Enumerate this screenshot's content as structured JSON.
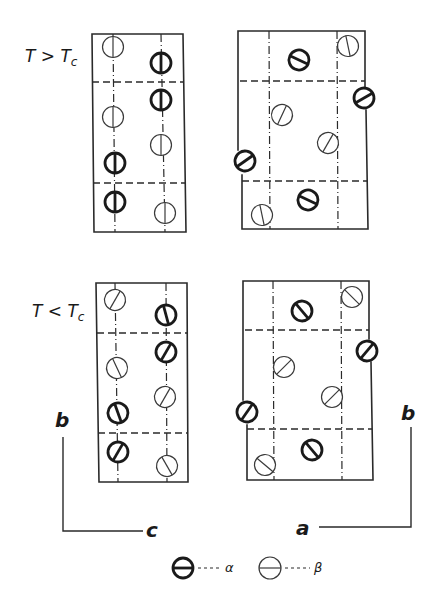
{
  "labels": {
    "above": {
      "main": "T > T",
      "sub": "c"
    },
    "below": {
      "main": "T < T",
      "sub": "c"
    },
    "axis_left_vertical": "b",
    "axis_left_horizontal": "c",
    "axis_right_vertical": "b",
    "axis_right_horizontal": "a"
  },
  "legend": [
    {
      "type": "alpha",
      "symbol": "α"
    },
    {
      "type": "beta",
      "symbol": "β"
    }
  ],
  "colors": {
    "ink": "#1a1a1a",
    "background": "#ffffff"
  },
  "panels": [
    {
      "id": "above-bc",
      "state": "T > Tc",
      "projection": "bc",
      "frame": [
        [
          92,
          34
        ],
        [
          183,
          34
        ],
        [
          186,
          232
        ],
        [
          94,
          232
        ],
        [
          92,
          34
        ]
      ],
      "dash_h": [
        [
          [
            92,
            82
          ],
          [
            184,
            82
          ]
        ],
        [
          [
            93,
            183
          ],
          [
            186,
            183
          ]
        ]
      ],
      "dash_v": [
        [
          [
            113,
            34
          ],
          [
            115,
            232
          ]
        ],
        [
          [
            161,
            34
          ],
          [
            165,
            232
          ]
        ]
      ],
      "atoms": [
        {
          "type": "beta",
          "x": 113,
          "y": 47,
          "angle": 90
        },
        {
          "type": "alpha",
          "x": 161,
          "y": 63,
          "angle": 90
        },
        {
          "type": "alpha",
          "x": 161,
          "y": 100,
          "angle": 90
        },
        {
          "type": "beta",
          "x": 113,
          "y": 117,
          "angle": 90
        },
        {
          "type": "beta",
          "x": 161,
          "y": 145,
          "angle": 90
        },
        {
          "type": "alpha",
          "x": 115,
          "y": 163,
          "angle": 90
        },
        {
          "type": "alpha",
          "x": 115,
          "y": 202,
          "angle": 90
        },
        {
          "type": "beta",
          "x": 165,
          "y": 213,
          "angle": 90
        }
      ]
    },
    {
      "id": "above-ab",
      "state": "T > Tc",
      "projection": "ab",
      "frame_segments": [
        [
          [
            238,
            150
          ],
          [
            238,
            31
          ],
          [
            365,
            31
          ],
          [
            365,
            88
          ]
        ],
        [
          [
            366,
            110
          ],
          [
            368,
            229
          ],
          [
            242,
            229
          ],
          [
            242,
            175
          ]
        ]
      ],
      "dash_h": [
        [
          [
            240,
            81
          ],
          [
            365,
            81
          ]
        ],
        [
          [
            242,
            181
          ],
          [
            367,
            181
          ]
        ]
      ],
      "dash_v": [
        [
          [
            269,
            31
          ],
          [
            270,
            229
          ]
        ],
        [
          [
            337,
            31
          ],
          [
            338,
            229
          ]
        ]
      ],
      "atoms": [
        {
          "type": "alpha",
          "x": 299,
          "y": 60,
          "angle": 25
        },
        {
          "type": "beta",
          "x": 348,
          "y": 46,
          "angle": 78
        },
        {
          "type": "alpha",
          "x": 364,
          "y": 98,
          "angle": -30
        },
        {
          "type": "beta",
          "x": 282,
          "y": 115,
          "angle": -65
        },
        {
          "type": "beta",
          "x": 328,
          "y": 143,
          "angle": -60
        },
        {
          "type": "alpha",
          "x": 245,
          "y": 161,
          "angle": -35
        },
        {
          "type": "alpha",
          "x": 308,
          "y": 200,
          "angle": 25
        },
        {
          "type": "beta",
          "x": 262,
          "y": 215,
          "angle": 78
        }
      ]
    },
    {
      "id": "below-bc",
      "state": "T < Tc",
      "projection": "bc",
      "frame": [
        [
          96,
          283
        ],
        [
          187,
          283
        ],
        [
          188,
          482
        ],
        [
          99,
          482
        ],
        [
          96,
          283
        ]
      ],
      "dash_h": [
        [
          [
            97,
            333
          ],
          [
            187,
            333
          ]
        ],
        [
          [
            98,
            433
          ],
          [
            188,
            433
          ]
        ]
      ],
      "dash_v": [
        [
          [
            115,
            283
          ],
          [
            118,
            482
          ]
        ],
        [
          [
            166,
            283
          ],
          [
            167,
            482
          ]
        ]
      ],
      "atoms": [
        {
          "type": "beta",
          "x": 115,
          "y": 300,
          "angle": -60
        },
        {
          "type": "alpha",
          "x": 166,
          "y": 315,
          "angle": 75
        },
        {
          "type": "alpha",
          "x": 166,
          "y": 352,
          "angle": -60
        },
        {
          "type": "beta",
          "x": 117,
          "y": 368,
          "angle": 65
        },
        {
          "type": "beta",
          "x": 165,
          "y": 397,
          "angle": -60
        },
        {
          "type": "alpha",
          "x": 118,
          "y": 413,
          "angle": 70
        },
        {
          "type": "alpha",
          "x": 118,
          "y": 452,
          "angle": -60
        },
        {
          "type": "beta",
          "x": 167,
          "y": 466,
          "angle": 60
        }
      ]
    },
    {
      "id": "below-ab",
      "state": "T < Tc",
      "projection": "ab",
      "frame_segments": [
        [
          [
            243,
            400
          ],
          [
            243,
            281
          ],
          [
            369,
            281
          ],
          [
            369,
            339
          ]
        ],
        [
          [
            371,
            362
          ],
          [
            373,
            480
          ],
          [
            247,
            480
          ],
          [
            247,
            425
          ]
        ]
      ],
      "dash_h": [
        [
          [
            245,
            330
          ],
          [
            369,
            330
          ]
        ],
        [
          [
            247,
            429
          ],
          [
            372,
            429
          ]
        ]
      ],
      "dash_v": [
        [
          [
            273,
            281
          ],
          [
            274,
            480
          ]
        ],
        [
          [
            341,
            281
          ],
          [
            342,
            480
          ]
        ]
      ],
      "atoms": [
        {
          "type": "alpha",
          "x": 302,
          "y": 311,
          "angle": 50
        },
        {
          "type": "beta",
          "x": 352,
          "y": 297,
          "angle": 45
        },
        {
          "type": "alpha",
          "x": 367,
          "y": 351,
          "angle": -50
        },
        {
          "type": "beta",
          "x": 284,
          "y": 367,
          "angle": -45
        },
        {
          "type": "beta",
          "x": 332,
          "y": 397,
          "angle": -45
        },
        {
          "type": "alpha",
          "x": 247,
          "y": 412,
          "angle": -55
        },
        {
          "type": "alpha",
          "x": 312,
          "y": 450,
          "angle": 50
        },
        {
          "type": "beta",
          "x": 265,
          "y": 465,
          "angle": 40
        }
      ]
    }
  ]
}
